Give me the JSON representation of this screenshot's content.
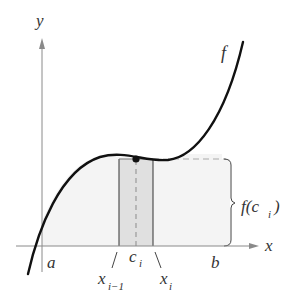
{
  "diagram": {
    "axes": {
      "x_label": "x",
      "y_label": "y"
    },
    "curve_label": "f",
    "labels": {
      "a": "a",
      "b": "b",
      "x_prev": "x",
      "x_prev_sub": "i−1",
      "c": "c",
      "c_sub": "i",
      "x_i": "x",
      "x_i_sub": "i",
      "height_f": "f(c",
      "height_sub": "i",
      "height_close": ")"
    },
    "colors": {
      "curve": "#111111",
      "axis": "#8a8a8a",
      "region_fill": "#f3f3f3",
      "rect_fill": "#dedede",
      "rect_stroke": "#333333",
      "dash": "#9a9a9a",
      "text": "#333333"
    }
  }
}
